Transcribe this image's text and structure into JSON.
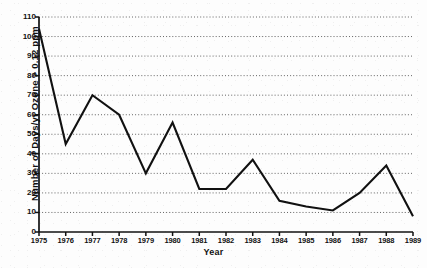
{
  "chart_data": {
    "type": "line",
    "title": "",
    "xlabel": "Year",
    "ylabel": "Number of Days/yr Ozone > 0.12 ppm",
    "categories": [
      1975,
      1976,
      1977,
      1978,
      1979,
      1980,
      1981,
      1982,
      1983,
      1984,
      1985,
      1986,
      1987,
      1988,
      1989
    ],
    "values": [
      104,
      45,
      70,
      60,
      30,
      56,
      22,
      22,
      37,
      16,
      13,
      11,
      20,
      34,
      8
    ],
    "series": [
      {
        "name": "Days/yr Ozone > 0.12 ppm",
        "values": [
          104,
          45,
          70,
          60,
          30,
          56,
          22,
          22,
          37,
          16,
          13,
          11,
          20,
          34,
          8
        ]
      }
    ],
    "xlim": [
      1975,
      1989
    ],
    "ylim": [
      0,
      110
    ],
    "ytick_labels": [
      "0",
      "10",
      "20",
      "30",
      "40",
      "50",
      "60",
      "70",
      "80",
      "90",
      "100",
      "110"
    ],
    "ytick_values": [
      0,
      10,
      20,
      30,
      40,
      50,
      60,
      70,
      80,
      90,
      100,
      110
    ],
    "xtick_labels": [
      "1975",
      "1976",
      "1977",
      "1978",
      "1979",
      "1980",
      "1981",
      "1982",
      "1983",
      "1984",
      "1985",
      "1986",
      "1987",
      "1988",
      "1989"
    ],
    "grid": "horizontal-dotted",
    "legend": "none",
    "line_color": "#111111",
    "grid_color": "#555555",
    "axis_color": "#111111",
    "background_color": "#fdfdfd"
  }
}
